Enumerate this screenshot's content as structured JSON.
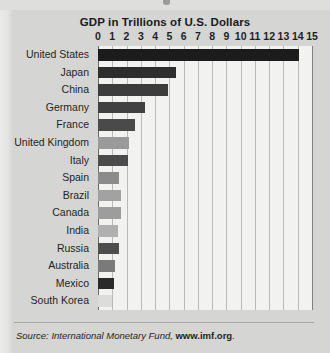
{
  "chart_data": {
    "type": "bar",
    "orientation": "horizontal",
    "title": "GDP in Trillions of U.S. Dollars",
    "xlabel": "",
    "ylabel": "",
    "xlim": [
      0,
      15
    ],
    "xticks": [
      "0",
      "1",
      "2",
      "3",
      "4",
      "5",
      "6",
      "7",
      "8",
      "9",
      "10",
      "11",
      "12",
      "13",
      "14",
      "15"
    ],
    "grid": "vertical",
    "legend": "none",
    "categories": [
      "United States",
      "Japan",
      "China",
      "Germany",
      "France",
      "United Kingdom",
      "Italy",
      "Spain",
      "Brazil",
      "Canada",
      "India",
      "Russia",
      "Australia",
      "Mexico",
      "South Korea"
    ],
    "values": [
      14.1,
      5.5,
      4.9,
      3.3,
      2.6,
      2.2,
      2.1,
      1.5,
      1.6,
      1.6,
      1.4,
      1.5,
      1.2,
      1.1,
      1.0
    ],
    "bar_colors": [
      "#1c1c1c",
      "#2e2e2e",
      "#3c3c3c",
      "#414141",
      "#4a4a4a",
      "#9a9a9a",
      "#4b4b4b",
      "#8b8b8b",
      "#a2a2a2",
      "#9d9d9d",
      "#b0b0b0",
      "#4e4e4e",
      "#7a7a7a",
      "#2a2a2a",
      "#dcdcda"
    ]
  },
  "source": {
    "prefix": "Source: International Monetary Fund, ",
    "url": "www.imf.org",
    "suffix": "."
  }
}
